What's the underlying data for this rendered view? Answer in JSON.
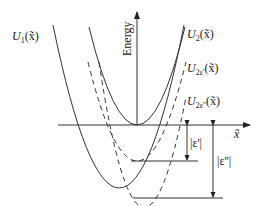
{
  "diagram": {
    "axes": {
      "y_label": "Energy",
      "x_label": "x̃"
    },
    "curves": [
      {
        "id": "U1",
        "label_main": "U",
        "label_sub": "1",
        "label_arg": "(x̃)",
        "style": "solid"
      },
      {
        "id": "U2",
        "label_main": "U",
        "label_sub": "2",
        "label_arg": "(x̃)",
        "style": "solid"
      },
      {
        "id": "U2e1",
        "label_main": "U",
        "label_sub": "2ε'",
        "label_arg": "(x̃)",
        "style": "dashed"
      },
      {
        "id": "U2e2",
        "label_main": "U",
        "label_sub": "2ε''",
        "label_arg": "(x̃)",
        "style": "dashed"
      }
    ],
    "annotations": [
      {
        "id": "eps1",
        "label": "|ε'|"
      },
      {
        "id": "eps2",
        "label": "|ε''|"
      }
    ],
    "colors": {
      "line": "#333333",
      "background": "#ffffff"
    }
  }
}
